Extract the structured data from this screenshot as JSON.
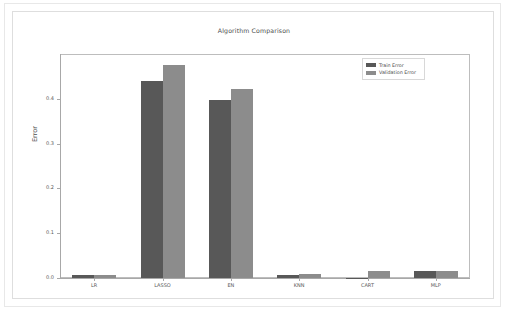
{
  "figure": {
    "title": "Algorithm Comparison",
    "ylabel": "Error",
    "frame_color": "#dedede"
  },
  "legend": {
    "entries": [
      {
        "label": "Train Error",
        "color": "#585858"
      },
      {
        "label": "Validation Error",
        "color": "#8c8c8c"
      }
    ]
  },
  "axis": {
    "yticks": [
      "0.0",
      "0.1",
      "0.2",
      "0.3",
      "0.4"
    ],
    "xticks": [
      "LR",
      "LASSO",
      "EN",
      "KNN",
      "CART",
      "MLP"
    ]
  },
  "chart_data": {
    "type": "bar",
    "title": "Algorithm Comparison",
    "xlabel": "",
    "ylabel": "Error",
    "ylim": [
      0.0,
      0.5
    ],
    "yticks": [
      0.0,
      0.1,
      0.2,
      0.3,
      0.4
    ],
    "grid": false,
    "legend_position": "upper right",
    "categories": [
      "LR",
      "LASSO",
      "EN",
      "KNN",
      "CART",
      "MLP"
    ],
    "series": [
      {
        "name": "Train Error",
        "color": "#585858",
        "values": [
          0.006,
          0.44,
          0.398,
          0.006,
          0.001,
          0.016
        ]
      },
      {
        "name": "Validation Error",
        "color": "#8c8c8c",
        "values": [
          0.006,
          0.476,
          0.422,
          0.009,
          0.016,
          0.015
        ]
      }
    ]
  }
}
